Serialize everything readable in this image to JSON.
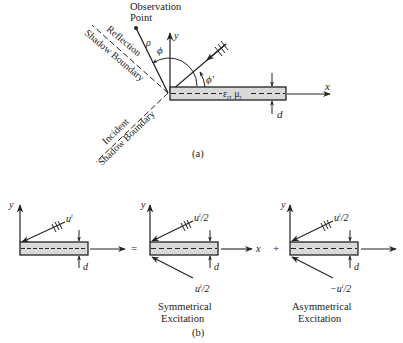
{
  "figure_a": {
    "observation_label_1": "Observation",
    "observation_label_2": "Point",
    "rho": "ρ",
    "phi": "ϕ",
    "phi_prime": "ϕ′",
    "y_axis": "y",
    "x_axis": "x",
    "material": "ε",
    "material_sub_r": "r",
    "material_mu": ", μ",
    "material_mu_sub": "r",
    "thickness": "d",
    "reflection_1": "Reflection",
    "reflection_2": "Shadow Boundary",
    "incident_1": "Incident",
    "incident_2": "Shadow Boundary",
    "caption": "(a)"
  },
  "figure_b": {
    "caption": "(b)",
    "equals": "=",
    "plus": "+",
    "panel_total": {
      "y_axis": "y",
      "incident": "u",
      "incident_sup": "i",
      "thickness": "d"
    },
    "panel_symmetric": {
      "y_axis": "y",
      "x_axis": "x",
      "upper": "u",
      "upper_sup": "i",
      "upper_tail": "/2",
      "lower": "u",
      "lower_sup": "i",
      "lower_tail": "/2",
      "thickness": "d",
      "title_1": "Symmetrical",
      "title_2": "Excitation"
    },
    "panel_asymmetric": {
      "y_axis": "y",
      "upper": "u",
      "upper_sup": "i",
      "upper_tail": "/2",
      "lower": "−u",
      "lower_sup": "i",
      "lower_tail": "/2",
      "thickness": "d",
      "title_1": "Asymmetrical",
      "title_2": "Excitation"
    }
  },
  "colors": {
    "ink": "#222222",
    "plate_fill": "#d9d9d9",
    "background": "#ffffff"
  }
}
